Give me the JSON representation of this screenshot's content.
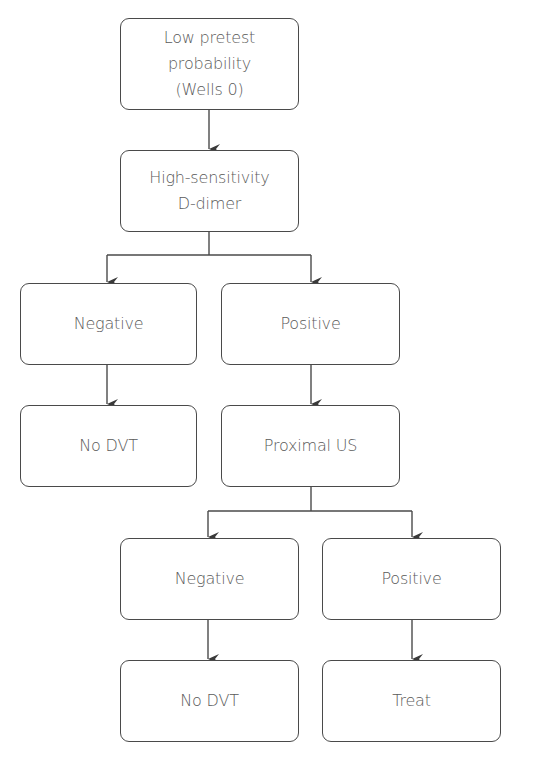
{
  "flowchart": {
    "nodes": [
      {
        "id": "pretest",
        "label": "Low pretest\nprobability\n(Wells 0)"
      },
      {
        "id": "ddimer",
        "label": "High-sensitivity\nD-dimer"
      },
      {
        "id": "ddimer-negative",
        "label": "Negative"
      },
      {
        "id": "ddimer-positive",
        "label": "Positive"
      },
      {
        "id": "no-dvt-1",
        "label": "No DVT"
      },
      {
        "id": "proximal-us",
        "label": "Proximal US"
      },
      {
        "id": "us-negative",
        "label": "Negative"
      },
      {
        "id": "us-positive",
        "label": "Positive"
      },
      {
        "id": "no-dvt-2",
        "label": "No DVT"
      },
      {
        "id": "treat",
        "label": "Treat"
      }
    ],
    "edges": [
      {
        "from": "pretest",
        "to": "ddimer"
      },
      {
        "from": "ddimer",
        "to": "ddimer-negative"
      },
      {
        "from": "ddimer",
        "to": "ddimer-positive"
      },
      {
        "from": "ddimer-negative",
        "to": "no-dvt-1"
      },
      {
        "from": "ddimer-positive",
        "to": "proximal-us"
      },
      {
        "from": "proximal-us",
        "to": "us-negative"
      },
      {
        "from": "proximal-us",
        "to": "us-positive"
      },
      {
        "from": "us-negative",
        "to": "no-dvt-2"
      },
      {
        "from": "us-positive",
        "to": "treat"
      }
    ]
  },
  "colors": {
    "stroke": "#4a4a4a",
    "text": "#5a5a5a",
    "background": "#ffffff"
  }
}
